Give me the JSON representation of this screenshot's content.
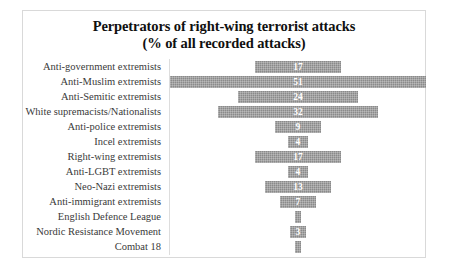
{
  "chart_data": {
    "type": "bar",
    "orientation": "horizontal",
    "alignment": "centered",
    "title": "Perpetrators of right-wing terrorist attacks (% of all recorded attacks)",
    "title_lines": [
      "Perpetrators of right-wing terrorist attacks",
      "(% of all recorded attacks)"
    ],
    "xlabel": "",
    "ylabel": "",
    "grid": false,
    "legend": false,
    "xlim": [
      0,
      51
    ],
    "value_unit": "%",
    "categories": [
      "Anti-government extremists",
      "Anti-Muslim extremists",
      "Anti-Semitic extremists",
      "White supremacists/Nationalists",
      "Anti-police extremists",
      "Incel extremists",
      "Right-wing extremists",
      "Anti-LGBT extremists",
      "Neo-Nazi extremists",
      "Anti-immigrant extremists",
      "English Defence League",
      "Nordic Resistance Movement",
      "Combat 18"
    ],
    "values": [
      17,
      51,
      24,
      32,
      9,
      4,
      17,
      4,
      13,
      7,
      1,
      3,
      1
    ],
    "labels": [
      "17",
      "51",
      "24",
      "32",
      "9",
      "4",
      "17",
      "4",
      "13",
      "7",
      "",
      "3",
      ""
    ],
    "series": [
      {
        "name": "% of all recorded attacks",
        "values": [
          17,
          51,
          24,
          32,
          9,
          4,
          17,
          4,
          13,
          7,
          1,
          3,
          1
        ]
      }
    ]
  },
  "style": {
    "bar_color": "#8a8a8a",
    "value_label_color": "#ffffff",
    "category_label_color": "#3a3a3a",
    "title_color": "#101010",
    "border_color": "#d9d9d9",
    "background": "#ffffff"
  }
}
